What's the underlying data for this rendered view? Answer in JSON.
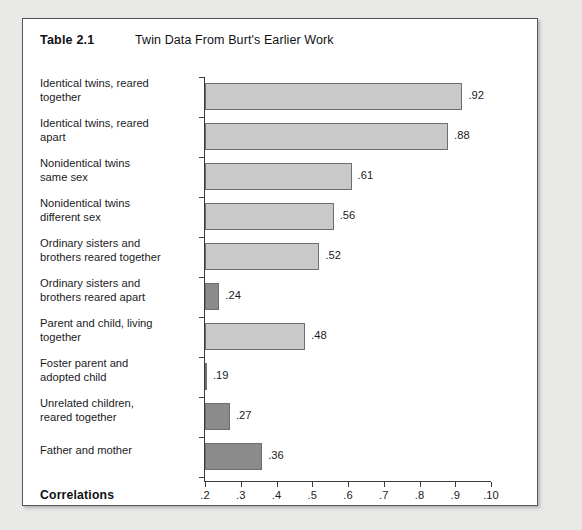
{
  "figure": {
    "table_number": "Table 2.1",
    "title": "Twin Data From Burt's Earlier Work",
    "axis_caption": "Correlations"
  },
  "chart_data": {
    "type": "bar",
    "orientation": "horizontal",
    "title": "Twin Data From Burt's Earlier Work",
    "xlabel": "Correlations",
    "ylabel": "",
    "xlim": [
      0.2,
      1.0
    ],
    "xticks": [
      0.2,
      0.3,
      0.4,
      0.5,
      0.6,
      0.7,
      0.8,
      0.9,
      1.0
    ],
    "xticklabels": [
      ".2",
      ".3",
      ".4",
      ".5",
      ".6",
      ".7",
      ".8",
      ".9",
      ".10"
    ],
    "grid": false,
    "legend": "none",
    "colors": {
      "light_bar": "#c9c9c9",
      "dark_bar": "#8b8b8b",
      "bar_outline": "#6e6e70",
      "axis": "#3a3a3c",
      "text": "#1b1b1e",
      "panel_background": "#ffffff",
      "page_background": "#e9e9e7",
      "panel_border": "#56565a"
    },
    "categories": [
      "Identical twins, reared together",
      "Identical twins, reared apart",
      "Nonidentical twins same sex",
      "Nonidentical twins different sex",
      "Ordinary sisters and brothers reared together",
      "Ordinary sisters and brothers reared apart",
      "Parent and child, living together",
      "Foster parent and adopted child",
      "Unrelated children, reared together",
      "Father and mother"
    ],
    "values": [
      0.92,
      0.88,
      0.61,
      0.56,
      0.52,
      0.24,
      0.48,
      0.19,
      0.27,
      0.36
    ],
    "value_labels": [
      ".92",
      ".88",
      ".61",
      ".56",
      ".52",
      ".24",
      ".48",
      ".19",
      ".27",
      ".36"
    ],
    "bars": [
      {
        "label_line1": "Identical twins, reared",
        "label_line2": "together",
        "value": 0.92,
        "value_label": ".92",
        "shade": "light"
      },
      {
        "label_line1": "Identical twins, reared",
        "label_line2": "apart",
        "value": 0.88,
        "value_label": ".88",
        "shade": "light"
      },
      {
        "label_line1": "Nonidentical twins",
        "label_line2": "same sex",
        "value": 0.61,
        "value_label": ".61",
        "shade": "light"
      },
      {
        "label_line1": "Nonidentical twins",
        "label_line2": "different sex",
        "value": 0.56,
        "value_label": ".56",
        "shade": "light"
      },
      {
        "label_line1": "Ordinary sisters and",
        "label_line2": "brothers reared together",
        "value": 0.52,
        "value_label": ".52",
        "shade": "light"
      },
      {
        "label_line1": "Ordinary sisters and",
        "label_line2": "brothers reared apart",
        "value": 0.24,
        "value_label": ".24",
        "shade": "dark"
      },
      {
        "label_line1": "Parent and child, living",
        "label_line2": "together",
        "value": 0.48,
        "value_label": ".48",
        "shade": "light"
      },
      {
        "label_line1": "Foster parent and",
        "label_line2": "adopted child",
        "value": 0.19,
        "value_label": ".19",
        "shade": "dark"
      },
      {
        "label_line1": "Unrelated children,",
        "label_line2": "reared together",
        "value": 0.27,
        "value_label": ".27",
        "shade": "dark"
      },
      {
        "label_line1": "Father and mother",
        "label_line2": "",
        "value": 0.36,
        "value_label": ".36",
        "shade": "dark"
      }
    ]
  }
}
